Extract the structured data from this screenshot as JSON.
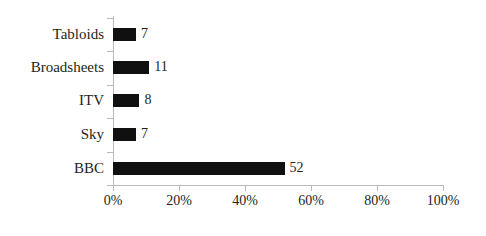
{
  "chart_data": {
    "type": "bar",
    "orientation": "horizontal",
    "title": "",
    "subtitle": "",
    "xlabel": "",
    "ylabel": "",
    "categories": [
      "Tabloids",
      "Broadsheets",
      "ITV",
      "Sky",
      "BBC"
    ],
    "values": [
      7,
      11,
      8,
      7,
      52
    ],
    "value_labels": [
      "7",
      "11",
      "8",
      "7",
      "52"
    ],
    "xlim": [
      0,
      100
    ],
    "xticks": [
      0,
      20,
      40,
      60,
      80,
      100
    ],
    "xtick_labels": [
      "0%",
      "20%",
      "40%",
      "60%",
      "80%",
      "100%"
    ],
    "grid": false,
    "legend": false,
    "legend_position": "none",
    "bar_color": "#101010",
    "axis_color": "#b9b9b9",
    "text_color": "#231f20",
    "background_color": "#ffffff"
  }
}
